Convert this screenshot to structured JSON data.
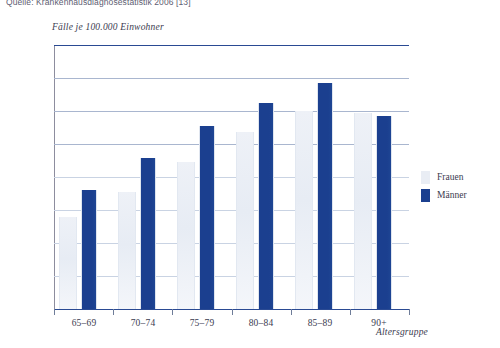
{
  "source_note": "Quelle: Krankenhausdiagnosestatistik 2006 [13]",
  "legend": {
    "frauen_label": "Frauen",
    "maenner_label": "Männer",
    "frauen_color": "#e9edf4",
    "maenner_color": "#1b3f8f"
  },
  "chart_data": {
    "type": "bar",
    "title": "",
    "subtitle": "",
    "ylabel": "Fälle je 100.000 Einwohner",
    "xlabel": "Altersgruppe",
    "categories": [
      "65–69",
      "70–74",
      "75–79",
      "80–84",
      "85–89",
      "90+"
    ],
    "series": [
      {
        "name": "Frauen",
        "color": "#e9edf4",
        "values": [
          28000,
          35500,
          44500,
          53500,
          60000,
          59500
        ]
      },
      {
        "name": "Männer",
        "color": "#1b3f8f",
        "values": [
          36000,
          45800,
          55500,
          62500,
          68500,
          58500
        ]
      }
    ],
    "ylim": [
      0,
      80000
    ],
    "ytick_values": [
      80000,
      70000,
      60000,
      50000,
      40000,
      30000,
      20000,
      10000
    ],
    "ytick_labels": [
      "80.000",
      "70.000",
      "60.000",
      "50.000",
      "40.000",
      "30.000",
      "20.000",
      "10.000"
    ],
    "grid": true,
    "legend_position": "right"
  }
}
